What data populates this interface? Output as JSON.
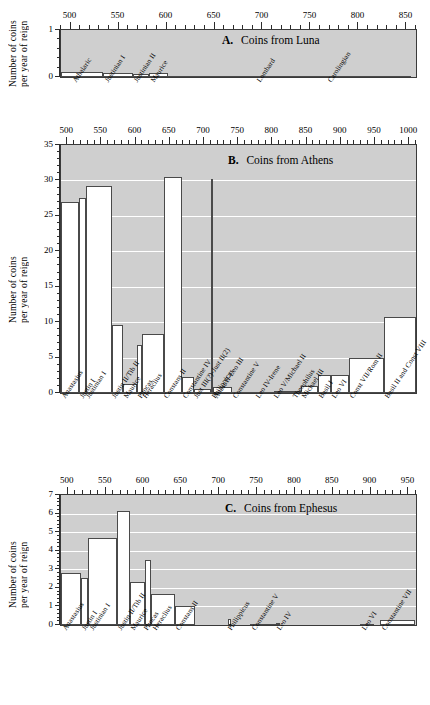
{
  "figure": {
    "shared_ylabel_line1": "Number of coins",
    "shared_ylabel_line2": "per year of reign"
  },
  "chart_data": [
    {
      "type": "bar",
      "panel": "A",
      "panel_letter": "A.",
      "title": "Coins from Luna",
      "title_full": "A.   Coins from Luna",
      "xlabel": "",
      "ylabel": "Number of coins per year of reign",
      "xlim": [
        490,
        860
      ],
      "ylim": [
        0,
        1
      ],
      "yticks": [
        0,
        1
      ],
      "xticks": [
        500,
        550,
        600,
        650,
        700,
        750,
        800,
        850
      ],
      "grid": false,
      "categories": [
        "Athalaric",
        "Justinian I",
        "Justinian II",
        "Maurice",
        "Lombard",
        "Carolingian"
      ],
      "bars": [
        {
          "label": "Athalaric",
          "start": 490,
          "end": 534,
          "value": 0.1
        },
        {
          "label": "Justinian I",
          "start": 534,
          "end": 565,
          "value": 0.08
        },
        {
          "label": "Justinian II",
          "start": 565,
          "end": 582,
          "value": 0.06
        },
        {
          "label": "Maurice",
          "start": 582,
          "end": 602,
          "value": 0.09
        },
        {
          "label": "Lombard",
          "start": 602,
          "end": 774,
          "value": 0.005
        },
        {
          "label": "Carolingian",
          "start": 774,
          "end": 855,
          "value": 0.005
        }
      ],
      "label_positions": [
        502,
        536,
        566,
        584,
        694,
        768
      ]
    },
    {
      "type": "bar",
      "panel": "B",
      "panel_letter": "B.",
      "title": "Coins from Athens",
      "title_full": "B.   Coins from Athens",
      "xlabel": "",
      "ylabel": "Number of coins per year of reign",
      "xlim": [
        491,
        1010
      ],
      "ylim": [
        0,
        35
      ],
      "yticks": [
        0,
        5,
        10,
        15,
        20,
        25,
        30,
        35
      ],
      "xticks": [
        500,
        550,
        600,
        650,
        700,
        750,
        800,
        850,
        900,
        950,
        1000
      ],
      "grid": true,
      "categories": [
        "Anastasius",
        "Justin I",
        "Justinian I",
        "Justin II/Tib II",
        "Maurice",
        "Phocas",
        "Heraclius",
        "Constans II",
        "Constantine IV",
        "Just III(?)-Just II(2)",
        "Philippicus",
        "Anast II-Leo III",
        "Constantine V",
        "Leo IV-Irene",
        "Leo V/Michael II",
        "Theophilus",
        "Michael III",
        "Basil I",
        "Leo VI",
        "Const VII/Rom II",
        "Basil II and Const VIII"
      ],
      "bars": [
        {
          "label": "Anastasius",
          "start": 491,
          "end": 518,
          "value": 27.0
        },
        {
          "label": "Justin I",
          "start": 518,
          "end": 527,
          "value": 27.5
        },
        {
          "label": "Justinian I",
          "start": 527,
          "end": 565,
          "value": 29.2
        },
        {
          "label": "Justin II/Tib II",
          "start": 565,
          "end": 582,
          "value": 9.6
        },
        {
          "label": "Maurice",
          "start": 582,
          "end": 602,
          "value": 1.3
        },
        {
          "label": "Phocas",
          "start": 602,
          "end": 610,
          "value": 6.8
        },
        {
          "label": "Heraclius",
          "start": 610,
          "end": 641,
          "value": 8.3
        },
        {
          "label": "Constans II",
          "start": 641,
          "end": 668,
          "value": 30.5
        },
        {
          "label": "Constantine IV",
          "start": 668,
          "end": 685,
          "value": 2.3
        },
        {
          "label": "Just III(?)-Just II(2)",
          "start": 685,
          "end": 711,
          "value": 0.6
        },
        {
          "label": "Philippicus",
          "start": 711,
          "end": 713,
          "value": 30.2
        },
        {
          "label": "Anast II-Leo III",
          "start": 713,
          "end": 741,
          "value": 0.9
        },
        {
          "label": "Constantine V",
          "start": 741,
          "end": 775,
          "value": 0.1
        },
        {
          "label": "Leo IV-Irene",
          "start": 775,
          "end": 802,
          "value": 0.15
        },
        {
          "label": "Leo V/Michael II",
          "start": 802,
          "end": 829,
          "value": 0.3
        },
        {
          "label": "Theophilus",
          "start": 829,
          "end": 842,
          "value": 0.35
        },
        {
          "label": "Michael III",
          "start": 842,
          "end": 867,
          "value": 1.0
        },
        {
          "label": "Basil I",
          "start": 867,
          "end": 886,
          "value": 2.5
        },
        {
          "label": "Leo VI",
          "start": 886,
          "end": 912,
          "value": 2.6
        },
        {
          "label": "Const VII/Rom II",
          "start": 912,
          "end": 963,
          "value": 5.0
        },
        {
          "label": "Basil II and Const VIII",
          "start": 963,
          "end": 1010,
          "value": 10.7
        }
      ]
    },
    {
      "type": "bar",
      "panel": "C",
      "panel_letter": "C.",
      "title": "Coins from Ephesus",
      "title_full": "C.   Coins from Ephesus",
      "xlabel": "",
      "ylabel": "Number of coins per year of reign",
      "xlim": [
        491,
        960
      ],
      "ylim": [
        0,
        7
      ],
      "yticks": [
        0,
        1,
        2,
        3,
        4,
        5,
        6,
        7
      ],
      "xticks": [
        500,
        550,
        600,
        650,
        700,
        750,
        800,
        850,
        900,
        950
      ],
      "grid": true,
      "categories": [
        "Anastasius",
        "Justin I",
        "Justinian I",
        "Justin II/Tib II",
        "Maurice",
        "Phocas",
        "Heraclius",
        "Constans II",
        "Philippicus",
        "Constantine V",
        "Leo IV",
        "Leo VI",
        "Constantine VII"
      ],
      "bars": [
        {
          "label": "Anastasius",
          "start": 491,
          "end": 518,
          "value": 2.8
        },
        {
          "label": "Justin I",
          "start": 518,
          "end": 527,
          "value": 2.55
        },
        {
          "label": "Justinian I",
          "start": 527,
          "end": 565,
          "value": 4.7
        },
        {
          "label": "Justin II/Tib II",
          "start": 565,
          "end": 582,
          "value": 6.15
        },
        {
          "label": "Maurice",
          "start": 582,
          "end": 602,
          "value": 2.3
        },
        {
          "label": "Phocas",
          "start": 602,
          "end": 610,
          "value": 3.5
        },
        {
          "label": "Heraclius",
          "start": 610,
          "end": 641,
          "value": 1.65
        },
        {
          "label": "Constans II",
          "start": 641,
          "end": 668,
          "value": 1.0
        },
        {
          "label": "gap",
          "start": 668,
          "end": 711,
          "value": 0.0
        },
        {
          "label": "Philippicus",
          "start": 711,
          "end": 715,
          "value": 0.35
        },
        {
          "label": "Constantine V",
          "start": 741,
          "end": 775,
          "value": 0.06
        },
        {
          "label": "Leo IV",
          "start": 775,
          "end": 780,
          "value": 0.12
        },
        {
          "label": "Leo VI",
          "start": 886,
          "end": 905,
          "value": 0.07
        },
        {
          "label": "Constantine VII",
          "start": 913,
          "end": 959,
          "value": 0.25
        }
      ],
      "label_positions": [
        493,
        519,
        529,
        566,
        584,
        600,
        612,
        643,
        712,
        743,
        777,
        888,
        915
      ]
    }
  ]
}
